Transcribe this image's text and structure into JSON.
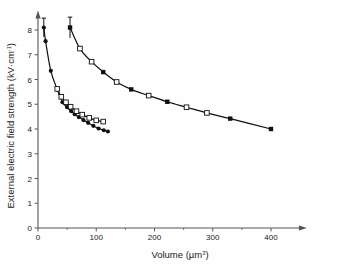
{
  "chart_data": {
    "type": "scatter",
    "title": "",
    "xlabel": "Volume  (µm³)",
    "ylabel": "External electric field strength  (kV·cm⁻¹)",
    "ylabel_main": "External electric field strength",
    "ylabel_unit": "(kV·cm",
    "ylabel_unit_sup": "-1",
    "ylabel_unit_close": ")",
    "xlabel_main": "Volume",
    "xlabel_unit": "(µm",
    "xlabel_unit_sup": "3",
    "xlabel_unit_close": ")",
    "xlim": [
      0,
      460
    ],
    "ylim": [
      0,
      8.75
    ],
    "xticks": [
      0,
      100,
      200,
      300,
      400
    ],
    "xticks_minor": [
      50,
      150,
      250,
      350
    ],
    "yticks": [
      0,
      1,
      2,
      3,
      4,
      5,
      6,
      7,
      8
    ],
    "xtick_labels": [
      "0",
      "100",
      "200",
      "300",
      "400"
    ],
    "ytick_labels": [
      "0",
      "1",
      "2",
      "3",
      "4",
      "5",
      "6",
      "7",
      "8"
    ],
    "grid": false,
    "legend": "none",
    "axis_arrows": true,
    "colors": {
      "axis": "#555555",
      "curve": "#101010",
      "marker_filled": "#101010",
      "marker_open_stroke": "#101010",
      "marker_open_fill": "#ffffff"
    },
    "series": [
      {
        "name": "series-steep-left",
        "marker": "filled-circle",
        "x": [
          10,
          13,
          22,
          33,
          42,
          50,
          57,
          63,
          70,
          78,
          86,
          95,
          104,
          113,
          120
        ],
        "y": [
          8.1,
          7.55,
          6.35,
          5.6,
          5.08,
          4.88,
          4.72,
          4.6,
          4.48,
          4.36,
          4.25,
          4.13,
          4.02,
          3.95,
          3.9
        ],
        "error_bars": [
          {
            "x": 10,
            "y": 8.1,
            "err": 0.38
          }
        ]
      },
      {
        "name": "series-open-square-lower",
        "marker": "open-square",
        "x": [
          33,
          40,
          48,
          56,
          66,
          76,
          88,
          100,
          112
        ],
        "y": [
          5.62,
          5.3,
          5.08,
          4.9,
          4.72,
          4.58,
          4.45,
          4.35,
          4.3
        ],
        "error_bars": []
      },
      {
        "name": "series-upper-right",
        "marker": "mixed-square",
        "x": [
          55,
          72,
          92,
          112,
          135,
          160,
          190,
          222,
          255,
          290,
          330,
          400
        ],
        "y": [
          8.1,
          7.25,
          6.72,
          6.3,
          5.9,
          5.6,
          5.35,
          5.1,
          4.88,
          4.65,
          4.42,
          4.0
        ],
        "marker_types": [
          "filled-square",
          "open-square",
          "open-square",
          "filled-square",
          "open-square",
          "filled-square",
          "open-square",
          "filled-square",
          "open-square",
          "open-square",
          "filled-square",
          "filled-square"
        ],
        "error_bars": [
          {
            "x": 55,
            "y": 8.1,
            "err": 0.42
          }
        ]
      }
    ]
  },
  "figure": {
    "caption": ""
  }
}
